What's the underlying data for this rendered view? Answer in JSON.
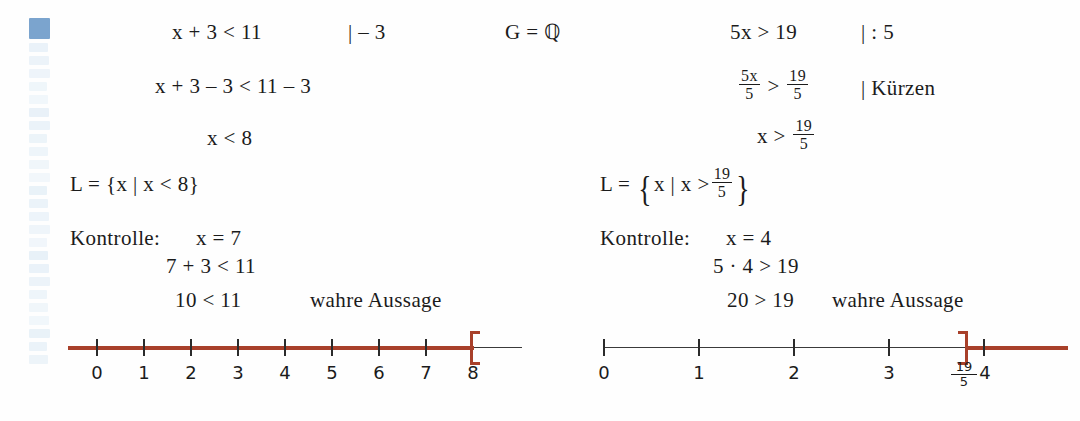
{
  "document": {
    "language": "de",
    "title": "Ungleichungen loesen - Beispiele",
    "margin_strip": {
      "name": "vertical-marker-strip",
      "block_count": 26,
      "highlight_color": "#7ba4ce",
      "faded_color": "#e8f1f8"
    },
    "colors": {
      "ink": "#1b1b1b",
      "accent_red": "#a8402a",
      "axis_black": "#3a3a3a",
      "page_background": "#fefefe"
    }
  },
  "left_example": {
    "line1": {
      "equation": "x + 3 < 11",
      "operation": "|  – 3",
      "domain": "G = ℚ"
    },
    "line2": "x + 3 – 3 < 11 – 3",
    "line3": "x < 8",
    "solution_set": {
      "lead": "L = ",
      "open_brace": "{",
      "body": "x | x < 8",
      "close_brace": "}"
    },
    "check": {
      "label": "Kontrolle:",
      "value": "x = 7",
      "step1": "7 + 3 < 11",
      "step2": "10 < 11",
      "verdict": "wahre Aussage"
    },
    "numberline": {
      "labels": [
        "0",
        "1",
        "2",
        "3",
        "4",
        "5",
        "6",
        "7",
        "8"
      ],
      "bracket_at": "8",
      "bracket_type": "open-right",
      "highlight_direction": "left",
      "axis_min": 0,
      "axis_max": 8
    }
  },
  "right_example": {
    "line1": {
      "equation": "5x > 19",
      "operation": "|  : 5"
    },
    "line2": {
      "left_num": "5x",
      "left_den": "5",
      "relation": ">",
      "right_num": "19",
      "right_den": "5",
      "operation": "|  Kürzen"
    },
    "line3": {
      "prefix": "x >",
      "num": "19",
      "den": "5"
    },
    "solution_set": {
      "lead": "L = ",
      "open_brace": "{",
      "body": "x | x >",
      "num": "19",
      "den": "5",
      "close_brace": "}"
    },
    "check": {
      "label": "Kontrolle:",
      "value": "x = 4",
      "step1": "5 · 4 > 19",
      "step2": "20 > 19",
      "verdict": "wahre Aussage"
    },
    "numberline": {
      "labels": [
        "0",
        "1",
        "2",
        "3"
      ],
      "frac_label": {
        "num": "19",
        "den": "5"
      },
      "last_label": "4",
      "bracket_at": "19/5",
      "bracket_type": "open-left",
      "highlight_direction": "right",
      "axis_min": 0,
      "axis_max": 4.6
    }
  }
}
